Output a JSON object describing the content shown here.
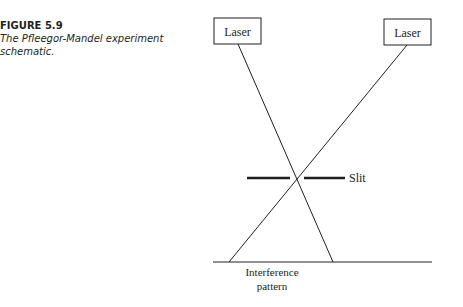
{
  "figure": {
    "number": "FIGURE 5.9",
    "caption": "The Pfleegor-Mandel experiment schematic."
  },
  "diagram": {
    "laser_left_label": "Laser",
    "laser_right_label": "Laser",
    "slit_label": "Slit",
    "screen_label_line1": "Interference",
    "screen_label_line2": "pattern"
  }
}
